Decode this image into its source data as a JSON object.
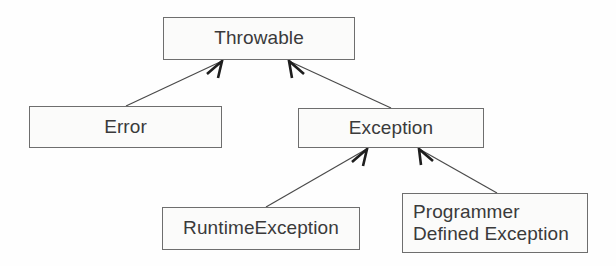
{
  "diagram": {
    "type": "class-hierarchy",
    "background_color": "#fefefe",
    "box_fill_color": "#fbfbfa",
    "box_border_color": "#6e6e6e",
    "text_color": "#3a3a3a",
    "edge_color": "#4a4a4a",
    "nodes": [
      {
        "id": "throwable",
        "label": "Throwable",
        "x": 163,
        "y": 17,
        "width": 192,
        "height": 43,
        "align": "center"
      },
      {
        "id": "error",
        "label": "Error",
        "x": 29,
        "y": 106,
        "width": 193,
        "height": 42,
        "align": "center"
      },
      {
        "id": "exception",
        "label": "Exception",
        "x": 298,
        "y": 108,
        "width": 186,
        "height": 40,
        "align": "center"
      },
      {
        "id": "runtime-exception",
        "label": "RuntimeException",
        "x": 162,
        "y": 207,
        "width": 198,
        "height": 43,
        "align": "center"
      },
      {
        "id": "programmer-defined-exception",
        "label": "Programmer\nDefined Exception",
        "x": 402,
        "y": 193,
        "width": 186,
        "height": 60,
        "align": "left"
      }
    ],
    "edges": [
      {
        "id": "error-to-throwable",
        "from": "error",
        "to": "throwable",
        "relation": "inherits",
        "x1": 126,
        "y1": 106,
        "x2": 222,
        "y2": 61,
        "head": "open-arrow"
      },
      {
        "id": "exception-to-throwable",
        "from": "exception",
        "to": "throwable",
        "relation": "inherits",
        "x1": 391,
        "y1": 108,
        "x2": 289,
        "y2": 61,
        "head": "open-arrow"
      },
      {
        "id": "runtimeexception-to-exception",
        "from": "runtime-exception",
        "to": "exception",
        "relation": "inherits",
        "x1": 266,
        "y1": 207,
        "x2": 367,
        "y2": 149,
        "head": "open-arrow"
      },
      {
        "id": "programmerdefined-to-exception",
        "from": "programmer-defined-exception",
        "to": "exception",
        "relation": "inherits",
        "x1": 497,
        "y1": 193,
        "x2": 419,
        "y2": 149,
        "head": "open-arrow"
      }
    ]
  }
}
